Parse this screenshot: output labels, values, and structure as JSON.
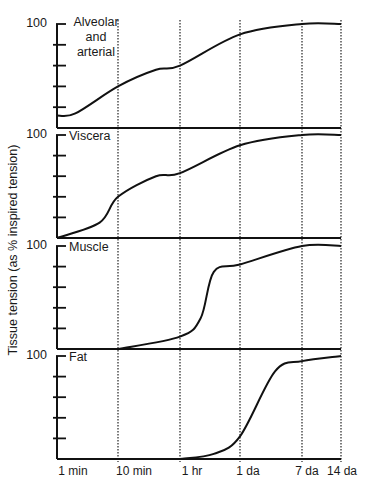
{
  "chart_data": [
    {
      "type": "line",
      "title": "Alveolar and arterial",
      "xlabel": "",
      "ylabel": "Tissue tension (as % inspired tension)",
      "x_scale": "log",
      "x_tick_labels": [
        "1 min",
        "10 min",
        "1 hr",
        "1 da",
        "7 da",
        "14 da"
      ],
      "ylim": [
        0,
        100
      ],
      "y_tick_labels": [
        "100"
      ],
      "y_minor_ticks": [
        20,
        40,
        60,
        80
      ],
      "grid": "vertical dotted lines at each x tick",
      "series": [
        {
          "name": "Alveolar and arterial",
          "x": [
            "1 min",
            "2 min",
            "10 min",
            "30 min",
            "1 hr",
            "1 da",
            "7 da",
            "14 da"
          ],
          "values": [
            12,
            14,
            40,
            56,
            60,
            90,
            100,
            100
          ]
        }
      ]
    },
    {
      "type": "line",
      "title": "Viscera",
      "x_scale": "log",
      "x_tick_labels": [
        "1 min",
        "10 min",
        "1 hr",
        "1 da",
        "7 da",
        "14 da"
      ],
      "ylim": [
        0,
        100
      ],
      "y_tick_labels": [
        "100"
      ],
      "series": [
        {
          "name": "Viscera",
          "x": [
            "1 min",
            "5 min",
            "10 min",
            "30 min",
            "1 hr",
            "1 da",
            "7 da",
            "14 da"
          ],
          "values": [
            0,
            15,
            40,
            60,
            63,
            90,
            100,
            100
          ]
        }
      ]
    },
    {
      "type": "line",
      "title": "Muscle",
      "x_scale": "log",
      "x_tick_labels": [
        "1 min",
        "10 min",
        "1 hr",
        "1 da",
        "7 da",
        "14 da"
      ],
      "ylim": [
        0,
        100
      ],
      "y_tick_labels": [
        "100"
      ],
      "series": [
        {
          "name": "Muscle",
          "x": [
            "10 min",
            "1 hr",
            "3 hr",
            "6 hr",
            "1 da",
            "7 da",
            "14 da"
          ],
          "values": [
            0,
            12,
            30,
            75,
            82,
            100,
            100
          ]
        }
      ]
    },
    {
      "type": "line",
      "title": "Fat",
      "x_scale": "log",
      "x_tick_labels": [
        "1 min",
        "10 min",
        "1 hr",
        "1 da",
        "7 da",
        "14 da"
      ],
      "ylim": [
        0,
        100
      ],
      "y_tick_labels": [
        "100"
      ],
      "series": [
        {
          "name": "Fat",
          "x": [
            "1 hr",
            "6 hr",
            "1 da",
            "3 da",
            "7 da",
            "14 da"
          ],
          "values": [
            0,
            5,
            22,
            85,
            95,
            100
          ]
        }
      ]
    }
  ],
  "labels": {
    "ylabel": "Tissue tension (as % inspired tension)",
    "y_top": "100",
    "panels": [
      "Alveolar and arterial",
      "Viscera",
      "Muscle",
      "Fat"
    ],
    "panel_title_lines": {
      "alveolar": [
        "Alveolar",
        "and",
        "arterial"
      ]
    },
    "x_ticks": [
      "1 min",
      "10 min",
      "1 hr",
      "1 da",
      "7 da",
      "14 da"
    ]
  }
}
